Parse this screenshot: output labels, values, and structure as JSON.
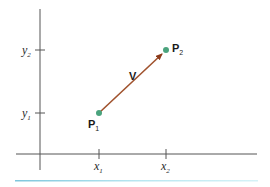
{
  "diagram": {
    "axes": {
      "x_ticks": [
        {
          "label": "x",
          "sub": "1"
        },
        {
          "label": "x",
          "sub": "2"
        }
      ],
      "y_ticks": [
        {
          "label": "y",
          "sub": "1"
        },
        {
          "label": "y",
          "sub": "2"
        }
      ]
    },
    "points": [
      {
        "label": "P",
        "sub": "1",
        "color": "#4aa37d"
      },
      {
        "label": "P",
        "sub": "2",
        "color": "#4aa37d"
      }
    ],
    "vector": {
      "label": "V",
      "color": "#a0522d"
    },
    "colors": {
      "axis": "#555555",
      "point": "#4aa37d",
      "vector": "#a0522d",
      "footer_rule": "#7fd3e6"
    }
  }
}
